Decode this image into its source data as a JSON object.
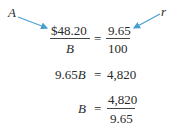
{
  "labels": {
    "a": "A",
    "r": "r"
  },
  "equation1": {
    "numerator_left": "$48.20",
    "denominator_left": "B",
    "equals": "=",
    "numerator_right": "9.65",
    "denominator_right": "100"
  },
  "equation2": {
    "left": "9.65",
    "left_var": "B",
    "equals": "=",
    "right": "4,820"
  },
  "equation3": {
    "left": "B",
    "equals": "=",
    "numerator": "4,820",
    "denominator": "9.65"
  },
  "colors": {
    "arrow": "#4a9fd0",
    "text": "#2a2a2a"
  }
}
